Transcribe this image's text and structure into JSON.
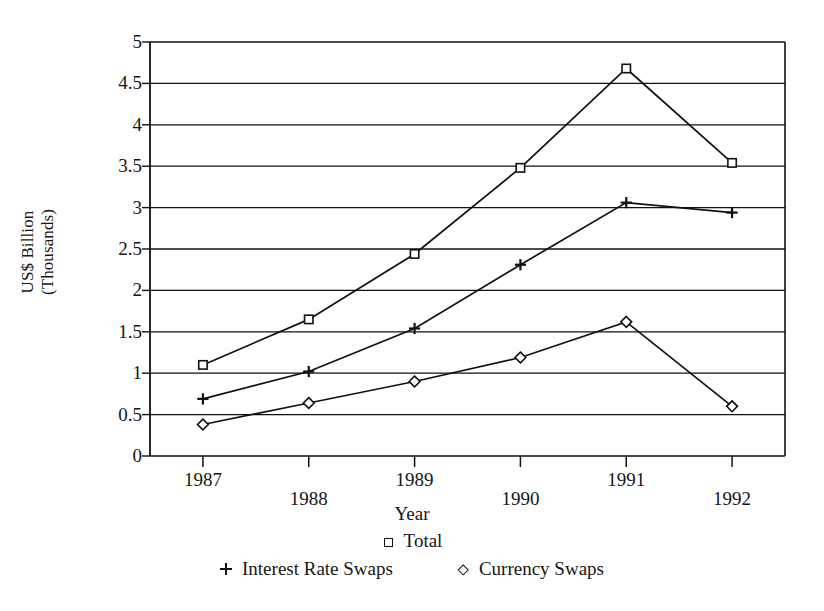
{
  "chart_data": {
    "type": "line",
    "title": "",
    "xlabel": "Year",
    "ylabel": "US$ Billion\n(Thousands)",
    "categories": [
      "1987",
      "1988",
      "1989",
      "1990",
      "1991",
      "1992"
    ],
    "x": [
      1987,
      1988,
      1989,
      1990,
      1991,
      1992
    ],
    "series": [
      {
        "name": "Total",
        "marker": "square",
        "values": [
          1.1,
          1.65,
          2.44,
          3.48,
          4.68,
          3.54
        ]
      },
      {
        "name": "Interest Rate Swaps",
        "marker": "plus",
        "values": [
          0.69,
          1.02,
          1.54,
          2.31,
          3.06,
          2.94
        ]
      },
      {
        "name": "Currency Swaps",
        "marker": "diamond",
        "values": [
          0.38,
          0.64,
          0.9,
          1.19,
          1.62,
          0.6
        ]
      }
    ],
    "ylim": [
      0,
      5
    ],
    "ytick_labels": [
      "0",
      "0.5",
      "1",
      "1.5",
      "2",
      "2.5",
      "3",
      "3.5",
      "4",
      "4.5",
      "5"
    ],
    "ytick_values": [
      0,
      0.5,
      1,
      1.5,
      2,
      2.5,
      3,
      3.5,
      4,
      4.5,
      5
    ],
    "grid": "horizontal",
    "legend_position": "bottom",
    "line_color": "#111111",
    "background_color": "#ffffff"
  },
  "axes": {
    "y_title": "US$ Billion\n(Thousands)",
    "x_title": "Year"
  },
  "legend": {
    "row1": [
      {
        "label": "Total",
        "marker": "square"
      }
    ],
    "row2": [
      {
        "label": "Interest Rate Swaps",
        "marker": "plus"
      },
      {
        "label": "Currency Swaps",
        "marker": "diamond"
      }
    ]
  }
}
